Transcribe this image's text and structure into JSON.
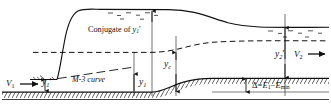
{
  "figure": {
    "type": "engineering-diagram",
    "width": 331,
    "height": 110,
    "colors": {
      "line": "#111111",
      "bed_fill": "#ffffff",
      "background": "#ffffff"
    }
  },
  "labels": {
    "conjugate": "Conjugate of",
    "conjugate_symbol": "y",
    "conjugate_sub": "1",
    "conjugate_prime": "′",
    "m3_curve": "M-3 curve",
    "v1": "V",
    "v1_sub": "1",
    "v2": "V",
    "v2_sub": "2",
    "y1_prime": "y",
    "y1_prime_sub": "1",
    "y1_prime_mark": "′",
    "y1": "y",
    "y1_sub": "1",
    "yc": "y",
    "yc_sub": "c",
    "y2_prime": "y",
    "y2_prime_sub": "2",
    "y2_prime_mark": "′",
    "delta_symbol": "Δ",
    "delta_equals": "=",
    "delta_e1": "E",
    "delta_e1_sub": "1",
    "delta_minus": "−",
    "delta_emin": "E",
    "delta_emin_sub": "min"
  },
  "geometry": {
    "bed_left_y": 92,
    "bed_right_y": 78,
    "step_start_x": 152,
    "step_end_x": 212,
    "upstream_surface_y": 80,
    "jump_start_x": 57,
    "jump_end_x": 80,
    "downstream_surface_y": 10,
    "tail_surface_y": 26,
    "dashed_level_y": 52
  }
}
